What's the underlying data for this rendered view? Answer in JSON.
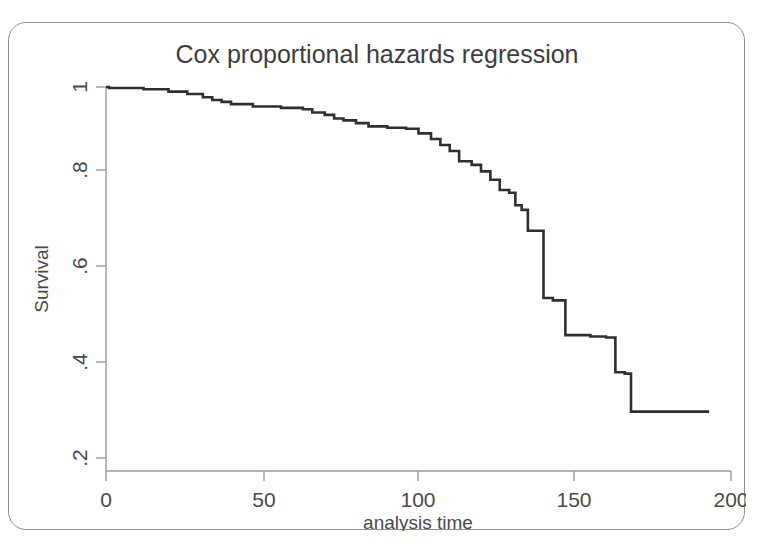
{
  "figure": {
    "title": "Cox proportional hazards regression",
    "frame_color": "#8e8e8e",
    "background": "#ffffff"
  },
  "axes": {
    "x": {
      "label": "analysis time",
      "ticks": [
        "0",
        "50",
        "100",
        "150",
        "200"
      ],
      "tick_values": [
        0,
        50,
        100,
        150,
        200
      ],
      "range": [
        0,
        200
      ]
    },
    "y": {
      "label": "Survival",
      "ticks": [
        ".2",
        ".4",
        ".6",
        ".8",
        "1"
      ],
      "tick_values": [
        0.2,
        0.4,
        0.6,
        0.8,
        1.0
      ],
      "range": [
        0.2,
        1.0
      ]
    }
  },
  "chart_data": {
    "type": "line",
    "subtype": "step-post survival function",
    "title": "Cox proportional hazards regression",
    "xlabel": "analysis time",
    "ylabel": "Survival",
    "xlim": [
      0,
      200
    ],
    "ylim": [
      0.2,
      1.0
    ],
    "grid": false,
    "legend": null,
    "line_color": "#2f2f2f",
    "series": [
      {
        "name": "Survival",
        "x": [
          1,
          12,
          20,
          26,
          31,
          34,
          37,
          40,
          47,
          56,
          63,
          66,
          70,
          73,
          76,
          80,
          84,
          90,
          96,
          100,
          104,
          107,
          110,
          113,
          117,
          120,
          123,
          126,
          129,
          131,
          133,
          135,
          140,
          143,
          147,
          155,
          160,
          163,
          166,
          168,
          193
        ],
        "y": [
          0.998,
          0.995,
          0.99,
          0.985,
          0.978,
          0.972,
          0.968,
          0.963,
          0.958,
          0.955,
          0.952,
          0.945,
          0.94,
          0.932,
          0.928,
          0.922,
          0.915,
          0.912,
          0.91,
          0.9,
          0.888,
          0.875,
          0.862,
          0.84,
          0.832,
          0.818,
          0.8,
          0.778,
          0.772,
          0.745,
          0.735,
          0.69,
          0.545,
          0.54,
          0.465,
          0.462,
          0.46,
          0.385,
          0.382,
          0.3,
          0.3
        ]
      }
    ]
  }
}
